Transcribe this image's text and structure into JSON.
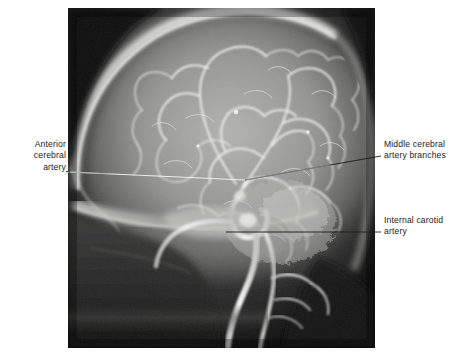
{
  "figure": {
    "kind": "medical-radiograph",
    "modality": "cerebral angiogram",
    "view": "lateral",
    "background_color": "#ffffff",
    "plate": {
      "x": 68,
      "y": 8,
      "width": 307,
      "height": 340,
      "base_color": "#0a0a0a",
      "description": "Lateral cerebral angiogram showing contrast-filled intracranial arteries against the skull."
    }
  },
  "annotations": [
    {
      "id": "anterior-cerebral-artery",
      "text": "Anterior\ncerebral\nartery",
      "align": "right",
      "side": "left",
      "text_color": "#1a1a1a",
      "leader": {
        "from_x": 68,
        "from_y": 172,
        "to_x": 245,
        "to_y": 180
      }
    },
    {
      "id": "middle-cerebral-artery-branches",
      "text": "Middle cerebral\nartery branches",
      "align": "left",
      "side": "right",
      "text_color": "#1a1a1a",
      "leader": {
        "from_x": 378,
        "from_y": 157,
        "to_x": 245,
        "to_y": 180
      }
    },
    {
      "id": "internal-carotid-artery",
      "text": "Internal carotid\nartery",
      "align": "left",
      "side": "right",
      "text_color": "#1a1a1a",
      "leader": {
        "from_x": 378,
        "from_y": 232,
        "to_x": 226,
        "to_y": 232
      }
    }
  ],
  "colors": {
    "page_background": "#ffffff",
    "label_text": "#1a1a1a",
    "leader_dark": "#1c1c1c",
    "leader_light": "#f2f2f2",
    "vessel_bright": "#f4f4f2",
    "brain_parenchyma": "#8e8e8c",
    "skull_vault": "#e8e8e4",
    "plate_dark": "#0a0a0a"
  }
}
